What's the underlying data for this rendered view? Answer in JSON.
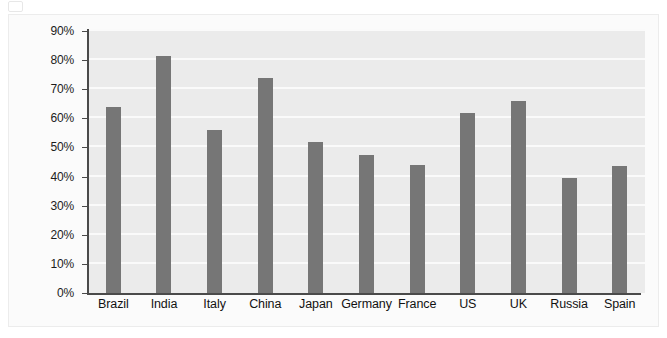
{
  "figure": {
    "scan_artifact": "scan-mark"
  },
  "chart_data": {
    "type": "bar",
    "title": "",
    "subtitle": "",
    "xlabel": "",
    "ylabel": "",
    "categories": [
      "Brazil",
      "India",
      "Italy",
      "China",
      "Japan",
      "Germany",
      "France",
      "US",
      "UK",
      "Russia",
      "Spain"
    ],
    "values": [
      64,
      81.5,
      56,
      74,
      52,
      47.5,
      44,
      62,
      66,
      39.5,
      43.5
    ],
    "value_labels": [
      "64%",
      "81.5%",
      "56%",
      "74%",
      "52%",
      "47.5%",
      "44%",
      "62%",
      "66%",
      "39.5%",
      "43.5%"
    ],
    "ylim": [
      0,
      90
    ],
    "ytick_values": [
      0,
      10,
      20,
      30,
      40,
      50,
      60,
      70,
      80,
      90
    ],
    "ytick_labels": [
      "0%",
      "10%",
      "20%",
      "30%",
      "40%",
      "50%",
      "60%",
      "70%",
      "80%",
      "90%"
    ],
    "grid": true,
    "grid_axis": "y",
    "legend": false,
    "legend_entries": [],
    "bar_color": "#767676",
    "plot_background": "#ebebeb",
    "gridline_color": "#fafafa",
    "axis_color": "#4a4a4a",
    "figure_background": "#fbfbfb"
  }
}
